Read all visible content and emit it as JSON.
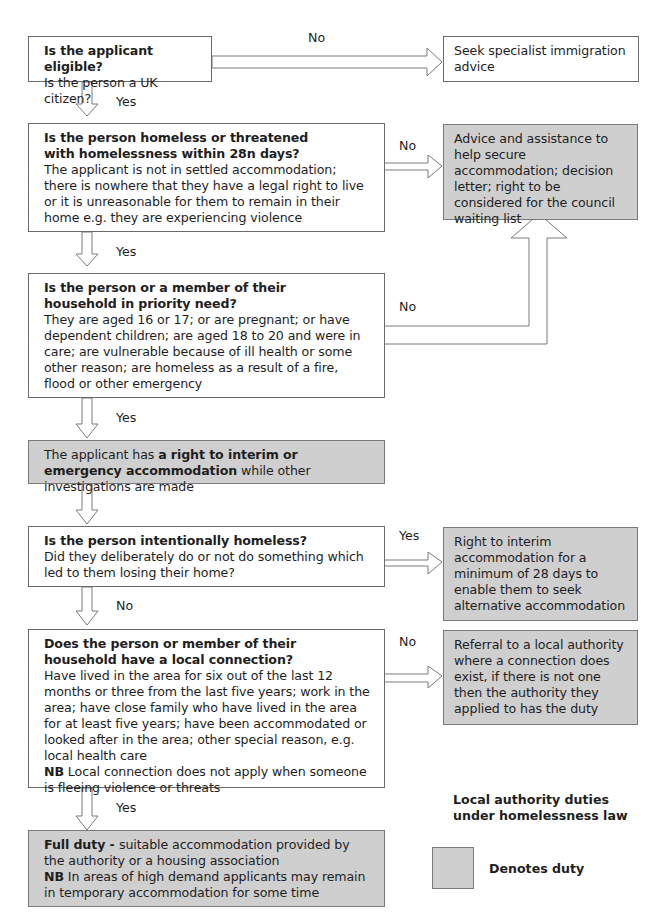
{
  "diagram": {
    "title": "Local authority duties under homelessness law",
    "legend": {
      "swatch_color": "#cfcfcf",
      "label": "Denotes duty"
    },
    "colors": {
      "duty_fill": "#cfcfcf",
      "box_border": "#6a6a6a",
      "arrow_stroke": "#7a7a7a"
    },
    "steps": [
      {
        "id": "eligible",
        "question": "Is the applicant eligible?",
        "detail": "Is the person a UK citizen?",
        "no_label": "No",
        "yes_label": "Yes",
        "no_outcome": "Seek specialist immigration advice"
      },
      {
        "id": "homeless",
        "question": "Is the person homeless or threatened with homelessness within 28n days?",
        "detail": "The applicant is not in settled accommodation; there is nowhere that they have a legal right to live or it is unreasonable for them to remain in their home e.g. they are experiencing violence",
        "no_label": "No",
        "yes_label": "Yes",
        "no_outcome": "Advice and assistance to help secure accommodation; decision letter; right to be considered for the council waiting list"
      },
      {
        "id": "priority",
        "question": "Is the person or a member of their household in priority need?",
        "detail": "They are aged 16 or 17; or are pregnant; or have dependent children; are aged 18 to 20 and  were in care; are vulnerable because of ill health or some other reason; are homeless as a result of a fire, flood or other emergency",
        "no_label": "No",
        "yes_label": "Yes"
      },
      {
        "id": "interim",
        "text_before": "The applicant has ",
        "text_bold": "a right to interim or emergency accommodation",
        "text_after": " while other investigations are made"
      },
      {
        "id": "intentional",
        "question": "Is the person intentionally homeless?",
        "detail": "Did they deliberately do or not do something which led to them losing their home?",
        "yes_label": "Yes",
        "no_label": "No",
        "yes_outcome": "Right to interim accommodation for a minimum of 28 days  to enable them to seek alternative accommodation"
      },
      {
        "id": "local",
        "question": "Does the person or member of their household have a local connection?",
        "detail": "Have lived in the area for six out of the last 12 months or three from the last five years; work in the area; have close family who have lived in the area for at least five years; have been accommodated or looked after in the area; other special reason, e.g. local health care",
        "nb_label": "NB",
        "nb_text": " Local connection does not apply when someone is fleeing violence or threats",
        "no_label": "No",
        "yes_label": "Yes",
        "no_outcome": "Referral to a local authority where a connection does exist, if there is not one then the authority they applied to has the duty"
      },
      {
        "id": "full",
        "bold": "Full duty - ",
        "text": "suitable accommodation provided by the authority or a housing association",
        "nb_label": "NB",
        "nb_text": " In areas of high demand applicants may remain in temporary accommodation for some time"
      }
    ]
  }
}
